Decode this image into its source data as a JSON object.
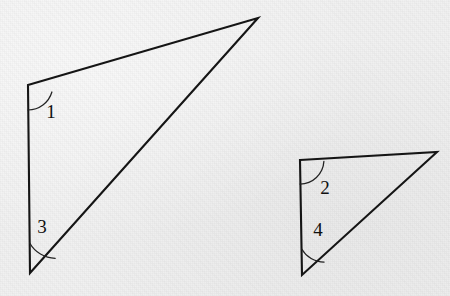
{
  "figure": {
    "background_color": "#f1f1f1",
    "line_color": "#151515",
    "label_color": "#101010",
    "arc_color": "#222222",
    "canvas": {
      "width": 450,
      "height": 296
    }
  },
  "shapes": [
    {
      "id": "large-triangle",
      "name": "Large triangle",
      "vertices": {
        "top_left": {
          "x": 28,
          "y": 85
        },
        "bottom_left": {
          "x": 30,
          "y": 273
        },
        "apex_right": {
          "x": 258,
          "y": 18
        }
      },
      "path": "M 28 85 L 258 18 L 30 273 Z",
      "angles": [
        {
          "label": "1",
          "vertex": "top_left",
          "label_pos": {
            "x": 51,
            "y": 114
          },
          "arc_path": "M 28 110 A 25 25 0 0 0 51.9 92.0"
        },
        {
          "label": "3",
          "vertex": "bottom_left",
          "label_pos": {
            "x": 42,
            "y": 229
          },
          "arc_path": "M 29.7 243 A 30 30 0 0 0 55.2 258.3"
        }
      ]
    },
    {
      "id": "small-triangle",
      "name": "Small triangle",
      "vertices": {
        "top_left": {
          "x": 300,
          "y": 160
        },
        "bottom_left": {
          "x": 302,
          "y": 275
        },
        "apex_right": {
          "x": 437,
          "y": 152
        }
      },
      "path": "M 300 160 L 437 152 L 302 275 Z",
      "angles": [
        {
          "label": "2",
          "vertex": "top_left",
          "label_pos": {
            "x": 325,
            "y": 190
          },
          "arc_path": "M 300 184 A 24 24 0 0 0 323.9 161.4"
        },
        {
          "label": "4",
          "vertex": "bottom_left",
          "label_pos": {
            "x": 318,
            "y": 232
          },
          "arc_path": "M 301.7 249 A 26 26 0 0 0 324.1 262.1"
        }
      ]
    }
  ]
}
